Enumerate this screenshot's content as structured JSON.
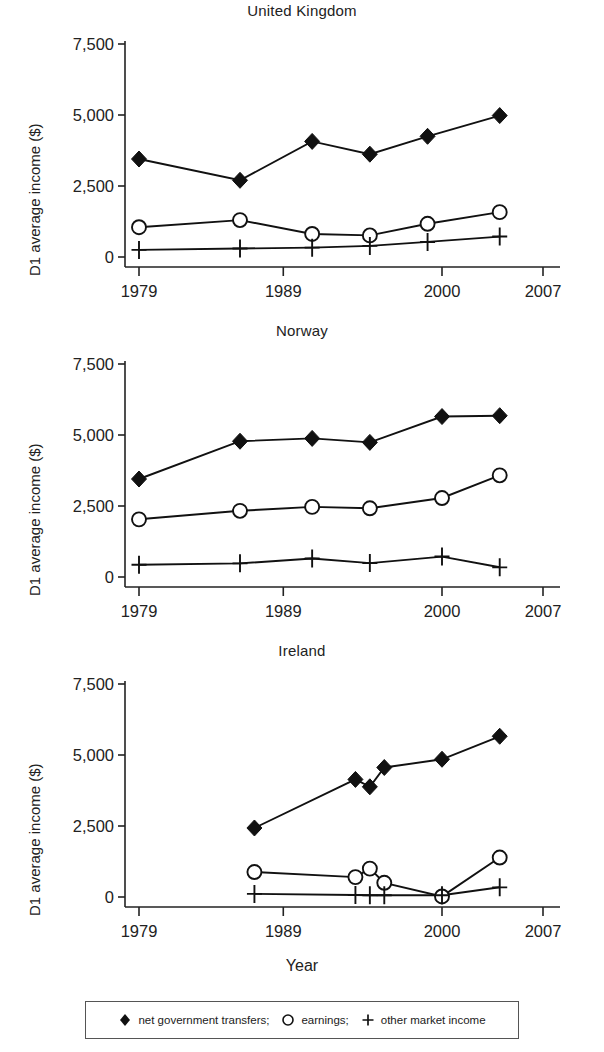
{
  "chart_data": {
    "type": "line",
    "title": "",
    "xlabel": "Year",
    "ylabel": "D1 average income ($)",
    "xlim": [
      1976,
      2008
    ],
    "ylim": [
      0,
      7500
    ],
    "xticks": [
      1979,
      1989,
      2000,
      2007
    ],
    "xtick_labels": [
      "1979",
      "1989",
      "2000",
      "2007"
    ],
    "yticks": [
      0,
      2500,
      5000,
      7500
    ],
    "ytick_labels": [
      "0",
      "2,500",
      "5,000",
      "7,500"
    ],
    "grid": false,
    "legend_position": "bottom",
    "panels": [
      {
        "title": "United Kingdom",
        "series": [
          {
            "name": "net government transfers;",
            "marker": "filled-diamond",
            "x": [
              1979,
              1986,
              1991,
              1995,
              1999,
              2004
            ],
            "values": [
              3450,
              2700,
              4070,
              3620,
              4250,
              4980
            ]
          },
          {
            "name": "earnings;",
            "marker": "open-circle",
            "x": [
              1979,
              1986,
              1991,
              1995,
              1999,
              2004
            ],
            "values": [
              1050,
              1300,
              810,
              760,
              1170,
              1580
            ]
          },
          {
            "name": "other market income",
            "marker": "plus",
            "x": [
              1979,
              1986,
              1991,
              1995,
              1999,
              2004
            ],
            "values": [
              250,
              300,
              330,
              390,
              530,
              720
            ]
          }
        ]
      },
      {
        "title": "Norway",
        "series": [
          {
            "name": "net government transfers;",
            "marker": "filled-diamond",
            "x": [
              1979,
              1986,
              1991,
              1995,
              2000,
              2004
            ],
            "values": [
              3450,
              4780,
              4880,
              4740,
              5650,
              5680
            ]
          },
          {
            "name": "earnings;",
            "marker": "open-circle",
            "x": [
              1979,
              1986,
              1991,
              1995,
              2000,
              2004
            ],
            "values": [
              2030,
              2330,
              2470,
              2420,
              2780,
              3580
            ]
          },
          {
            "name": "other market income",
            "marker": "plus",
            "x": [
              1979,
              1986,
              1991,
              1995,
              2000,
              2004
            ],
            "values": [
              430,
              480,
              650,
              490,
              720,
              340
            ]
          }
        ]
      },
      {
        "title": "Ireland",
        "series": [
          {
            "name": "net government transfers;",
            "marker": "filled-diamond",
            "x": [
              1987,
              1994,
              1995,
              1996,
              2000,
              2004
            ],
            "values": [
              2430,
              4140,
              3880,
              4560,
              4850,
              5660
            ]
          },
          {
            "name": "earnings;",
            "marker": "open-circle",
            "x": [
              1987,
              1994,
              1995,
              1996,
              2000,
              2004
            ],
            "values": [
              880,
              700,
              1000,
              500,
              20,
              1390
            ]
          },
          {
            "name": "other market income",
            "marker": "plus",
            "x": [
              1987,
              1994,
              1995,
              1996,
              2000,
              2004
            ],
            "values": [
              110,
              70,
              60,
              60,
              60,
              340
            ]
          }
        ]
      }
    ],
    "legend": [
      {
        "label": "net government transfers;",
        "marker": "filled-diamond"
      },
      {
        "label": "earnings;",
        "marker": "open-circle"
      },
      {
        "label": "other market income",
        "marker": "plus"
      }
    ],
    "colors": {
      "ink": "#1a1a1a",
      "background": "#ffffff"
    }
  }
}
